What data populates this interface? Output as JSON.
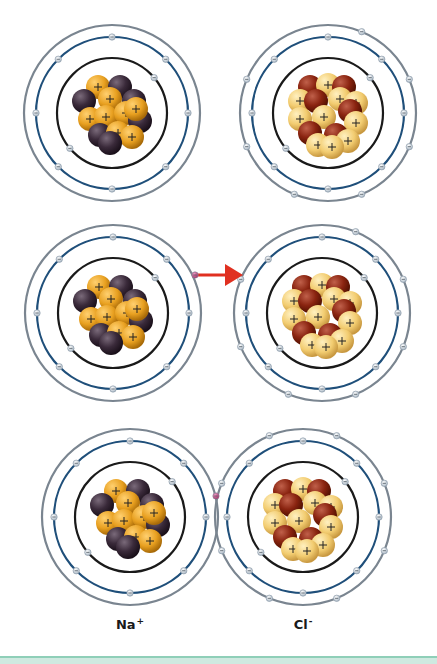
{
  "diagram": {
    "colors": {
      "outer_shell": "#7a8590",
      "middle_shell": "#1f4f7a",
      "inner_shell": "#1a1a1a",
      "electron": "#dfe7ee",
      "transfer_electron": "#c0487a",
      "arrow": "#e03020",
      "na_proton": "#e8a020",
      "na_neutron": "#3a2a3a",
      "cl_proton": "#f2cc70",
      "cl_neutron": "#8a2410",
      "footer": "#cfe9e0"
    },
    "rows": [
      {
        "step": 1,
        "atoms": [
          {
            "name": "sodium-atom",
            "element": "Na",
            "cx": 112,
            "cy": 113,
            "type": "na",
            "outer_electrons": 0
          },
          {
            "name": "chlorine-atom",
            "element": "Cl",
            "cx": 328,
            "cy": 113,
            "type": "cl",
            "outer_electrons": 7
          }
        ]
      },
      {
        "step": 2,
        "atoms": [
          {
            "name": "sodium-atom",
            "element": "Na",
            "cx": 113,
            "cy": 313,
            "type": "na",
            "outer_electrons": 1
          },
          {
            "name": "chlorine-atom",
            "element": "Cl",
            "cx": 322,
            "cy": 313,
            "type": "cl",
            "outer_electrons": 7
          }
        ],
        "arrow": {
          "x1": 197,
          "y1": 275,
          "x2": 243,
          "y2": 275,
          "label": "electron transfer"
        }
      },
      {
        "step": 3,
        "atoms": [
          {
            "name": "sodium-ion",
            "element": "Na+",
            "cx": 130,
            "cy": 517,
            "type": "na",
            "outer_electrons": 0
          },
          {
            "name": "chlorine-ion",
            "element": "Cl-",
            "cx": 303,
            "cy": 517,
            "type": "cl",
            "outer_electrons": 8
          }
        ],
        "shared_electron": {
          "x": 216,
          "y": 496
        }
      }
    ],
    "labels": [
      {
        "name": "sodium-ion-label",
        "symbol": "Na",
        "charge": "+",
        "x": 130,
        "y": 624
      },
      {
        "name": "chloride-ion-label",
        "symbol": "Cl",
        "charge": "-",
        "x": 303,
        "y": 624
      }
    ],
    "nucleus_sign": "+",
    "electron_sign": "-"
  }
}
